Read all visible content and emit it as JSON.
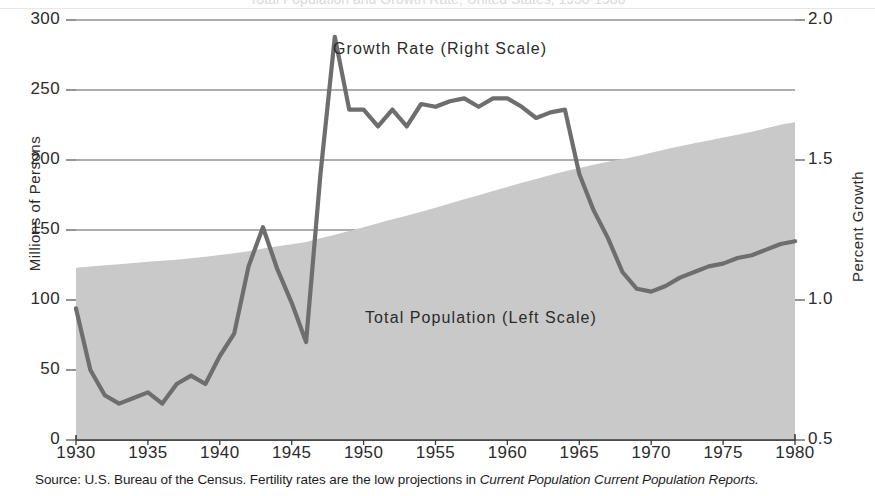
{
  "figure": {
    "cut_off_title": "",
    "source_prefix": "Source: U.S. Bureau of the Census. Fertility rates are the low projections in ",
    "source_italic": "Current Population Current Population Reports."
  },
  "axes": {
    "left_title": "Millions of Persons",
    "right_title": "Percent Growth",
    "left_ticks": [
      "300",
      "250",
      "200",
      "150",
      "100",
      "50",
      "0"
    ],
    "right_ticks": [
      "2.0",
      "1.5",
      "1.0",
      "0.5"
    ],
    "x_ticks": [
      "1930",
      "1935",
      "1940",
      "1945",
      "1950",
      "1955",
      "1960",
      "1965",
      "1970",
      "1975",
      "1980"
    ]
  },
  "annotations": {
    "growth": "Growth Rate (Right Scale)",
    "population": "Total Population (Left Scale)"
  },
  "colors": {
    "area_fill": "#c9c9c9",
    "line": "#6e6e6e",
    "grid": "#5a5a5a",
    "axis": "#3a3a3a",
    "text": "#2b2b2b"
  },
  "chart_data": {
    "type": "area",
    "title": "Total Population and Growth Rate, United States, 1930-1980",
    "xlabel": "",
    "grid": true,
    "legend": "in-plot annotations",
    "x": [
      1930,
      1931,
      1932,
      1933,
      1934,
      1935,
      1936,
      1937,
      1938,
      1939,
      1940,
      1941,
      1942,
      1943,
      1944,
      1945,
      1946,
      1947,
      1948,
      1949,
      1950,
      1951,
      1952,
      1953,
      1954,
      1955,
      1956,
      1957,
      1958,
      1959,
      1960,
      1961,
      1962,
      1963,
      1964,
      1965,
      1966,
      1967,
      1968,
      1969,
      1970,
      1971,
      1972,
      1973,
      1974,
      1975,
      1976,
      1977,
      1978,
      1979,
      1980
    ],
    "series": [
      {
        "name": "Total Population (Left Scale)",
        "axis": "left",
        "ylabel": "Millions of Persons",
        "ylim": [
          0,
          300
        ],
        "yticks": [
          0,
          50,
          100,
          150,
          200,
          250,
          300
        ],
        "style": "filled area",
        "values": [
          123.1,
          124.0,
          124.8,
          125.6,
          126.4,
          127.3,
          128.1,
          128.8,
          129.8,
          130.9,
          132.1,
          133.4,
          134.9,
          136.7,
          138.4,
          139.9,
          141.4,
          144.1,
          146.6,
          149.2,
          151.9,
          154.9,
          157.6,
          160.2,
          163.0,
          165.9,
          168.9,
          172.0,
          174.9,
          177.8,
          180.7,
          183.7,
          186.5,
          189.2,
          191.9,
          194.3,
          196.6,
          198.7,
          200.7,
          202.7,
          205.1,
          207.7,
          209.9,
          211.9,
          213.9,
          216.0,
          218.0,
          220.2,
          222.6,
          225.1,
          227.2
        ]
      },
      {
        "name": "Growth Rate (Right Scale)",
        "axis": "right",
        "ylabel": "Percent Growth",
        "ylim": [
          0.5,
          2.0
        ],
        "yticks": [
          0.5,
          1.0,
          1.5,
          2.0
        ],
        "style": "thick line",
        "values": [
          0.97,
          0.75,
          0.66,
          0.63,
          0.65,
          0.67,
          0.63,
          0.7,
          0.73,
          0.7,
          0.8,
          0.88,
          1.12,
          1.26,
          1.11,
          0.99,
          0.85,
          1.45,
          1.94,
          1.68,
          1.68,
          1.62,
          1.68,
          1.62,
          1.7,
          1.69,
          1.71,
          1.72,
          1.69,
          1.72,
          1.72,
          1.69,
          1.65,
          1.67,
          1.68,
          1.45,
          1.32,
          1.22,
          1.1,
          1.04,
          1.03,
          1.05,
          1.08,
          1.1,
          1.12,
          1.13,
          1.15,
          1.16,
          1.18,
          1.2,
          1.21
        ]
      }
    ]
  }
}
